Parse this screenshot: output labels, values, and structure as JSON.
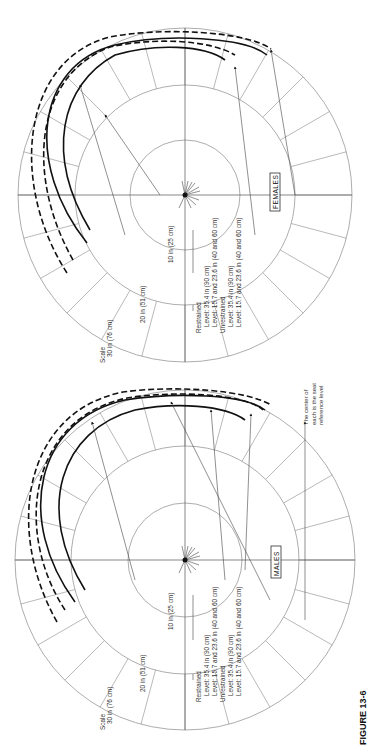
{
  "figure": {
    "label": "FIGURE 13-6",
    "note_lines": [
      "The center of",
      "each is the seat",
      "reference level"
    ]
  },
  "scale": {
    "title": "Scale",
    "rings": [
      {
        "label": "10 in (25 cm)",
        "inches": 10
      },
      {
        "label": "20 in (51 cm)",
        "inches": 20
      },
      {
        "label": "30 in (76 cm)",
        "inches": 30
      }
    ]
  },
  "legend": {
    "restrained_heading": "Restrained",
    "restrained_high": "Level: 35.4 in (90 cm)",
    "restrained_low": "Level: 15.7 and 23.6 in (40 and 60 cm)",
    "unrestrained_heading": "Unrestrained",
    "unrestrained_high": "Level: 35.4 in (90 cm)",
    "unrestrained_low": "Level: 15.7 and 23.6 in (40 and 60 cm)"
  },
  "diagrams": [
    {
      "id": "females",
      "label": "FEMALES"
    },
    {
      "id": "males",
      "label": "MALES"
    }
  ],
  "colors": {
    "background": "#ffffff",
    "grid": "#8a8a8a",
    "curve": "#111111",
    "text": "#333333"
  }
}
